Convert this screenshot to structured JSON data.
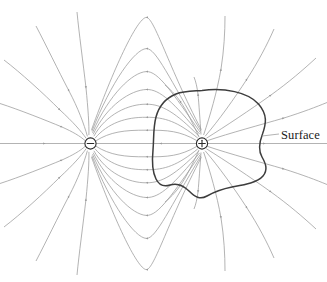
{
  "figure": {
    "type": "physics-field-diagram",
    "width": 327,
    "height": 282,
    "background_color": "#ffffff"
  },
  "labels": {
    "surface": "Surface"
  },
  "charges": [
    {
      "id": "negative-charge",
      "sign": "−",
      "symbol_name": "minus-sign",
      "x": 90.5,
      "y": 143.5,
      "radius": 5.6,
      "outline_color": "#2b2b2b",
      "fill_color": "#ffffff"
    },
    {
      "id": "positive-charge",
      "sign": "+",
      "symbol_name": "plus-sign",
      "x": 202.0,
      "y": 143.5,
      "radius": 5.6,
      "outline_color": "#2b2b2b",
      "fill_color": "#ffffff"
    }
  ],
  "field": {
    "line_color": "#9a9a9a",
    "arrow_color": "#9a9a9a",
    "line_width": 0.75,
    "direction": "from positive charge to negative charge",
    "line_count": 34
  },
  "surface": {
    "name": "gaussian-surface",
    "stroke_color": "#3d3d3d",
    "stroke_width": 1.5,
    "encloses": "positive-charge",
    "label_anchor": {
      "x": 283,
      "y": 137
    },
    "leader_line": {
      "x1": 262,
      "y1": 136,
      "x2": 279,
      "y2": 134
    }
  },
  "chart_data": {
    "type": "scatter",
    "xlabel": "",
    "ylabel": "",
    "annotations": [
      "Surface"
    ],
    "series": [
      {
        "name": "negative charge",
        "x": [
          90.5
        ],
        "y": [
          143.5
        ]
      },
      {
        "name": "positive charge",
        "x": [
          202.0
        ],
        "y": [
          143.5
        ]
      }
    ]
  }
}
